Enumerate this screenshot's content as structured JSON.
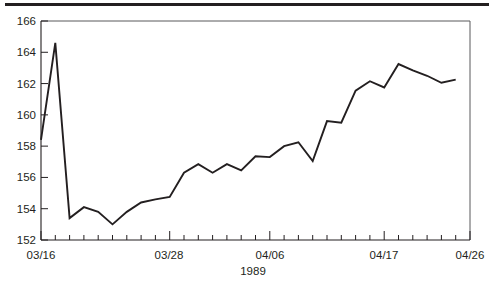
{
  "figure": {
    "background_color": "#ffffff",
    "line_color": "#231f20",
    "frame_color": "#58595b",
    "top_rule": "horizontal-rule"
  },
  "axis": {
    "y_ticks": [
      "166",
      "164",
      "162",
      "160",
      "158",
      "156",
      "154",
      "152"
    ],
    "x_ticks": [
      "03/16",
      "03/28",
      "04/06",
      "04/17",
      "04/26"
    ],
    "x_title": "1989"
  },
  "chart_data": {
    "type": "line",
    "title": "",
    "xlabel": "1989",
    "ylabel": "",
    "ylim": [
      152,
      166
    ],
    "ytick_step": 2,
    "grid": false,
    "legend": null,
    "x_tick_labels": [
      "03/16",
      "03/28",
      "04/06",
      "04/17",
      "04/26"
    ],
    "x_tick_indices": [
      0,
      9,
      16,
      24,
      30
    ],
    "n_minor_ticks": 31,
    "x": [
      "03/16",
      "03/17",
      "03/20",
      "03/21",
      "03/22",
      "03/23",
      "03/24",
      "03/27",
      "03/28",
      "03/29",
      "03/30",
      "03/31",
      "04/03",
      "04/04",
      "04/05",
      "04/06",
      "04/07",
      "04/10",
      "04/11",
      "04/12",
      "04/13",
      "04/14",
      "04/17",
      "04/18",
      "04/19",
      "04/20",
      "04/21",
      "04/24",
      "04/25",
      "04/26"
    ],
    "values": [
      158.4,
      164.6,
      153.4,
      154.1,
      153.8,
      153.0,
      153.8,
      154.4,
      154.6,
      154.75,
      156.3,
      156.85,
      156.3,
      156.85,
      156.45,
      157.35,
      157.3,
      158.0,
      158.25,
      157.05,
      159.6,
      159.5,
      161.55,
      162.15,
      161.75,
      163.25,
      162.85,
      162.5,
      162.05,
      162.25
    ],
    "series": [
      {
        "name": "series-1",
        "values": [
          158.4,
          164.6,
          153.4,
          154.1,
          153.8,
          153.0,
          153.8,
          154.4,
          154.6,
          154.75,
          156.3,
          156.85,
          156.3,
          156.85,
          156.45,
          157.35,
          157.3,
          158.0,
          158.25,
          157.05,
          159.6,
          159.5,
          161.55,
          162.15,
          161.75,
          163.25,
          162.85,
          162.5,
          162.05,
          162.25
        ]
      }
    ]
  }
}
